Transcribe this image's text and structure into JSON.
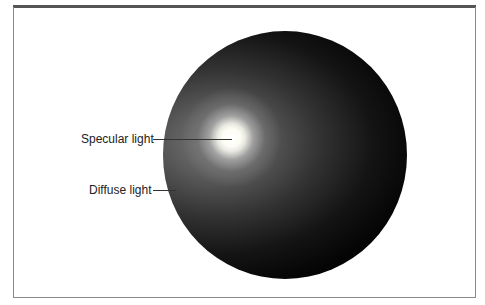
{
  "diagram": {
    "title": "",
    "labels": [
      {
        "text": "Specular light",
        "target": "bright highlight spot"
      },
      {
        "text": "Diffuse light",
        "target": "soft gray shading on sphere edge"
      }
    ],
    "colors": {
      "sphere_dark": "#000000",
      "diffuse_gray": "#6e6e6e",
      "specular_highlight": "#ffffff",
      "frame_border": "#8a8a8a",
      "top_rule": "#555555"
    }
  }
}
